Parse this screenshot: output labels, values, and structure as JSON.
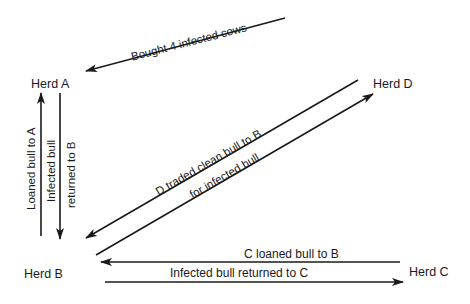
{
  "nodes": {
    "herd_a": "Herd A",
    "herd_b": "Herd B",
    "herd_c": "Herd C",
    "herd_d": "Herd D"
  },
  "edges": {
    "d_to_a": "Bought 4 infected cows",
    "b_to_a": "Loaned bull to A",
    "a_to_b_line1": "Infected bull",
    "a_to_b_line2": "returned to B",
    "d_b_line1": "D traded clean bull to B",
    "d_b_line2": "for infected bull",
    "c_to_b": "C loaned bull to B",
    "b_to_c": "Infected bull returned to C"
  },
  "colors": {
    "line": "#1a1a1a",
    "background": "#ffffff"
  }
}
